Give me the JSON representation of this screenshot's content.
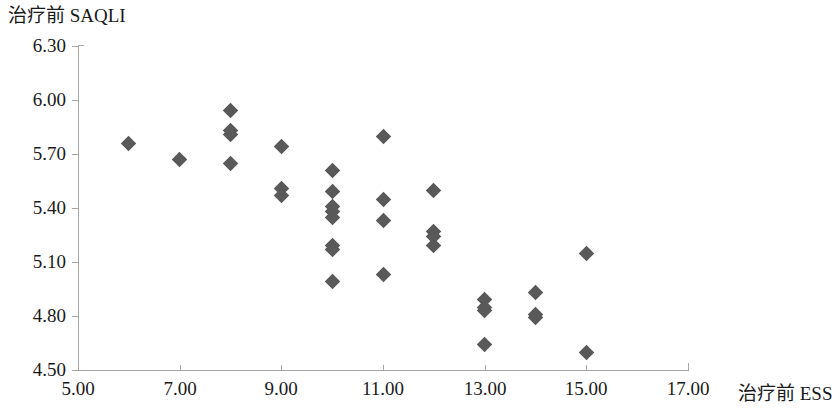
{
  "chart_data": {
    "type": "scatter",
    "title": "",
    "xlabel": "治疗前 ESS",
    "ylabel": "治疗前 SAQLI",
    "xlim": [
      5.0,
      17.0
    ],
    "ylim": [
      4.5,
      6.3
    ],
    "xticks": [
      5.0,
      7.0,
      9.0,
      11.0,
      13.0,
      15.0,
      17.0
    ],
    "xtick_labels": [
      "5.00",
      "7.00",
      "9.00",
      "11.00",
      "13.00",
      "15.00",
      "17.00"
    ],
    "yticks": [
      4.5,
      4.8,
      5.1,
      5.4,
      5.7,
      6.0,
      6.3
    ],
    "ytick_labels": [
      "4.50",
      "4.80",
      "5.10",
      "5.40",
      "5.70",
      "6.00",
      "6.30"
    ],
    "grid": false,
    "legend": null,
    "marker": "diamond",
    "marker_color": "#595959",
    "axis_color": "#a6a6a6",
    "points": [
      {
        "x": 6.0,
        "y": 5.76
      },
      {
        "x": 7.0,
        "y": 5.67
      },
      {
        "x": 8.0,
        "y": 5.94
      },
      {
        "x": 8.0,
        "y": 5.83
      },
      {
        "x": 8.0,
        "y": 5.81
      },
      {
        "x": 8.0,
        "y": 5.65
      },
      {
        "x": 9.0,
        "y": 5.74
      },
      {
        "x": 9.0,
        "y": 5.51
      },
      {
        "x": 9.0,
        "y": 5.47
      },
      {
        "x": 10.0,
        "y": 5.61
      },
      {
        "x": 10.0,
        "y": 5.49
      },
      {
        "x": 10.0,
        "y": 5.41
      },
      {
        "x": 10.0,
        "y": 5.38
      },
      {
        "x": 10.0,
        "y": 5.35
      },
      {
        "x": 10.0,
        "y": 5.19
      },
      {
        "x": 10.0,
        "y": 5.17
      },
      {
        "x": 10.0,
        "y": 4.99
      },
      {
        "x": 11.0,
        "y": 5.8
      },
      {
        "x": 11.0,
        "y": 5.45
      },
      {
        "x": 11.0,
        "y": 5.33
      },
      {
        "x": 11.0,
        "y": 5.03
      },
      {
        "x": 12.0,
        "y": 5.5
      },
      {
        "x": 12.0,
        "y": 5.27
      },
      {
        "x": 12.0,
        "y": 5.24
      },
      {
        "x": 12.0,
        "y": 5.19
      },
      {
        "x": 13.0,
        "y": 4.89
      },
      {
        "x": 13.0,
        "y": 4.85
      },
      {
        "x": 13.0,
        "y": 4.83
      },
      {
        "x": 13.0,
        "y": 4.64
      },
      {
        "x": 14.0,
        "y": 4.93
      },
      {
        "x": 14.0,
        "y": 4.81
      },
      {
        "x": 14.0,
        "y": 4.79
      },
      {
        "x": 15.0,
        "y": 5.15
      },
      {
        "x": 15.0,
        "y": 4.6
      }
    ]
  },
  "axis": {
    "y_title": "治疗前 SAQLI",
    "x_title": "治疗前 ESS"
  }
}
